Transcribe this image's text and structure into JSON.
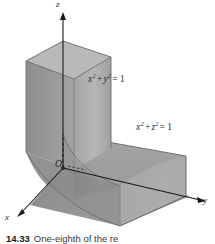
{
  "figure": {
    "axes": {
      "x_label": "x",
      "y_label": "y",
      "z_label": "z",
      "origin_label": "O"
    },
    "equations": {
      "cylinder_xy": {
        "var1": "x",
        "exp1": "2",
        "operator": "+",
        "var2": "y",
        "exp2": "2",
        "equals": "=",
        "value": "1",
        "full": "x2 + y2 = 1"
      },
      "cylinder_xz": {
        "var1": "x",
        "exp1": "2",
        "operator": "+",
        "var2": "z",
        "exp2": "2",
        "equals": "=",
        "value": "1",
        "full": "x2 + z2 = 1"
      }
    },
    "caption": {
      "number": "14.33",
      "text": "One-eighth of the re"
    },
    "colors": {
      "background": "#ffffff",
      "axis": "#1a1a1a",
      "surface_light": "#b4b4b4",
      "surface_mid": "#9a9a9a",
      "surface_dark": "#7f7f7f",
      "surface_darkest": "#6d6d6d",
      "edge": "#6b6b6b",
      "label_text": "#2b2b2b"
    }
  }
}
